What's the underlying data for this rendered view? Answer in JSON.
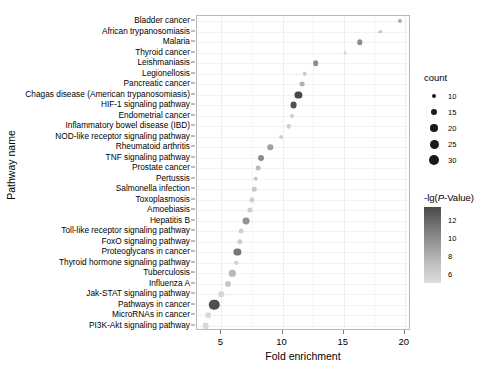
{
  "chart_data": {
    "type": "scatter",
    "title": "",
    "xlabel": "Fold enrichment",
    "ylabel": "Pathway name",
    "xlim": [
      3.0,
      20.5
    ],
    "xticks": [
      5,
      10,
      15,
      20
    ],
    "xtick_labels": [
      "5",
      "10",
      "15",
      "20"
    ],
    "grid": true,
    "legend_position": "right",
    "size_legend": {
      "title": "count",
      "values": [
        10,
        15,
        20,
        25,
        30
      ],
      "labels": [
        "10",
        "15",
        "20",
        "25",
        "30"
      ]
    },
    "color_legend": {
      "title": "-lg(P-Value)",
      "ticks": [
        12,
        10,
        8,
        6
      ],
      "tick_labels": [
        "12",
        "10",
        "8",
        "6"
      ],
      "range": [
        5,
        13.5
      ],
      "low_color": "#dcdcdc",
      "high_color": "#4a4a4a"
    },
    "categories": [
      "Bladder cancer",
      "African trypanosomiasis",
      "Malaria",
      "Thyroid cancer",
      "Leishmaniasis",
      "Legionellosis",
      "Pancreatic cancer",
      "Chagas disease (American trypanosomiasis)",
      "HIF-1 signaling pathway",
      "Endometrial cancer",
      "Inflammatory bowel disease (IBD)",
      "NOD-like receptor signaling pathway",
      "Rheumatoid arthritis",
      "TNF signaling pathway",
      "Prostate cancer",
      "Pertussis",
      "Salmonella infection",
      "Toxoplasmosis",
      "Amoebiasis",
      "Hepatitis B",
      "Toll-like receptor signaling pathway",
      "FoxO signaling pathway",
      "Proteoglycans in cancer",
      "Thyroid hormone signaling pathway",
      "Tuberculosis",
      "Influenza A",
      "Jak-STAT signaling pathway",
      "Pathways in cancer",
      "MicroRNAs in cancer",
      "PI3K-Akt signaling pathway"
    ],
    "points": [
      {
        "pathway": "Bladder cancer",
        "fold_enrichment": 19.6,
        "count": 9,
        "neglog_p": 8.0
      },
      {
        "pathway": "African trypanosomiasis",
        "fold_enrichment": 18.0,
        "count": 6,
        "neglog_p": 6.4
      },
      {
        "pathway": "Malaria",
        "fold_enrichment": 16.3,
        "count": 13,
        "neglog_p": 9.6
      },
      {
        "pathway": "Thyroid cancer",
        "fold_enrichment": 15.1,
        "count": 5,
        "neglog_p": 5.6
      },
      {
        "pathway": "Leishmaniasis",
        "fold_enrichment": 12.7,
        "count": 14,
        "neglog_p": 9.6
      },
      {
        "pathway": "Legionellosis",
        "fold_enrichment": 11.8,
        "count": 10,
        "neglog_p": 6.3
      },
      {
        "pathway": "Pancreatic cancer",
        "fold_enrichment": 11.6,
        "count": 11,
        "neglog_p": 7.6
      },
      {
        "pathway": "Chagas disease (American trypanosomiasis)",
        "fold_enrichment": 11.3,
        "count": 19,
        "neglog_p": 13.3
      },
      {
        "pathway": "HIF-1 signaling pathway",
        "fold_enrichment": 10.9,
        "count": 18,
        "neglog_p": 12.8
      },
      {
        "pathway": "Endometrial cancer",
        "fold_enrichment": 10.8,
        "count": 8,
        "neglog_p": 6.1
      },
      {
        "pathway": "Inflammatory bowel disease (IBD)",
        "fold_enrichment": 10.5,
        "count": 10,
        "neglog_p": 6.0
      },
      {
        "pathway": "NOD-like receptor signaling pathway",
        "fold_enrichment": 9.9,
        "count": 8,
        "neglog_p": 5.9
      },
      {
        "pathway": "Inflammatory bowel disease (IBD) b",
        "fold_enrichment": 9.9,
        "count": 8,
        "neglog_p": 5.9
      },
      {
        "pathway": "Rheumatoid arthritis",
        "fold_enrichment": 9.0,
        "count": 13,
        "neglog_p": 8.6
      },
      {
        "pathway": "TNF signaling pathway",
        "fold_enrichment": 8.2,
        "count": 15,
        "neglog_p": 9.6
      },
      {
        "pathway": "Prostate cancer",
        "fold_enrichment": 8.0,
        "count": 11,
        "neglog_p": 7.1
      },
      {
        "pathway": "Pertussis",
        "fold_enrichment": 7.8,
        "count": 10,
        "neglog_p": 6.5
      },
      {
        "pathway": "Salmonella infection",
        "fold_enrichment": 7.7,
        "count": 10,
        "neglog_p": 6.4
      },
      {
        "pathway": "Toxoplasmosis",
        "fold_enrichment": 7.5,
        "count": 12,
        "neglog_p": 6.1
      },
      {
        "pathway": "Amoebiasis",
        "fold_enrichment": 7.3,
        "count": 12,
        "neglog_p": 6.1
      },
      {
        "pathway": "Hepatitis B",
        "fold_enrichment": 7.0,
        "count": 18,
        "neglog_p": 9.2
      },
      {
        "pathway": "Toll-like receptor signaling pathway",
        "fold_enrichment": 6.6,
        "count": 11,
        "neglog_p": 6.0
      },
      {
        "pathway": "FoxO signaling pathway",
        "fold_enrichment": 6.5,
        "count": 13,
        "neglog_p": 6.1
      },
      {
        "pathway": "Proteoglycans in cancer",
        "fold_enrichment": 6.3,
        "count": 19,
        "neglog_p": 10.8
      },
      {
        "pathway": "Thyroid hormone signaling pathway",
        "fold_enrichment": 6.2,
        "count": 10,
        "neglog_p": 5.6
      },
      {
        "pathway": "Tuberculosis",
        "fold_enrichment": 5.9,
        "count": 16,
        "neglog_p": 7.2
      },
      {
        "pathway": "Influenza A",
        "fold_enrichment": 5.5,
        "count": 15,
        "neglog_p": 6.4
      },
      {
        "pathway": "Jak-STAT signaling pathway",
        "fold_enrichment": 5.0,
        "count": 13,
        "neglog_p": 5.6
      },
      {
        "pathway": "Pathways in cancer",
        "fold_enrichment": 4.4,
        "count": 30,
        "neglog_p": 12.9
      },
      {
        "pathway": "MicroRNAs in cancer",
        "fold_enrichment": 3.9,
        "count": 14,
        "neglog_p": 5.4
      },
      {
        "pathway": "PI3K-Akt signaling pathway",
        "fold_enrichment": 3.7,
        "count": 18,
        "neglog_p": 5.5
      }
    ]
  }
}
